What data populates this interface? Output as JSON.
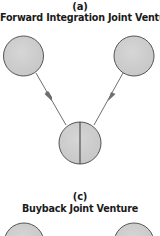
{
  "sections": [
    {
      "letter": "(a)",
      "title": "Forward Integration Joint Venture",
      "nodes": [
        {
          "id": "partner-left",
          "shape": "circle"
        },
        {
          "id": "partner-right",
          "shape": "circle"
        },
        {
          "id": "joint-venture",
          "shape": "split-circle"
        }
      ],
      "edges": [
        {
          "from": "partner-left",
          "to": "joint-venture",
          "arrow": "mid"
        },
        {
          "from": "partner-right",
          "to": "joint-venture",
          "arrow": "mid"
        }
      ]
    },
    {
      "letter": "(c)",
      "title": "Buyback Joint Venture",
      "nodes": [
        {
          "id": "partner-left",
          "shape": "circle"
        },
        {
          "id": "partner-right",
          "shape": "circle"
        }
      ]
    }
  ],
  "colors": {
    "node_fill": "#cfcfcf",
    "node_stroke": "#555555",
    "edge": "#6e6e6e",
    "text": "#1a1a1a"
  }
}
